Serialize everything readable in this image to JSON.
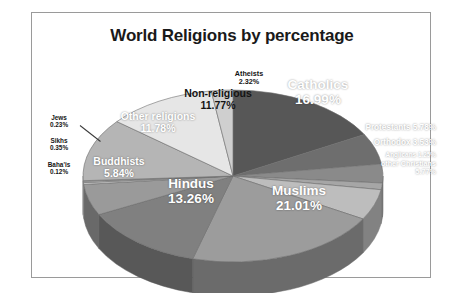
{
  "chart": {
    "title": "World Religions by percentage",
    "border_color": "#9a9a9a",
    "background": "#ffffff"
  },
  "chart_data": {
    "type": "pie",
    "title": "World Religions by percentage",
    "xlabel": "",
    "ylabel": "",
    "units": "percent",
    "three_d": true,
    "legend": "none",
    "labels_position": "inside-and-callout",
    "categories": [
      "Catholics",
      "Protestants",
      "Orthodox",
      "Anglicans",
      "other Christians",
      "Muslims",
      "Hindus",
      "Buddhists",
      "Sikhs",
      "Jews",
      "Baha'is",
      "other religions",
      "Non-religious",
      "Atheists"
    ],
    "values": [
      16.99,
      5.78,
      3.53,
      1.25,
      5.77,
      21.01,
      13.26,
      5.84,
      0.35,
      0.23,
      0.12,
      11.78,
      11.77,
      2.32
    ],
    "slices": [
      {
        "name": "Catholics",
        "value": 16.99,
        "label": "Catholics",
        "value_label": "16.99%",
        "color": "#575757",
        "side_color": "#3c3c3c",
        "text_color": "#ffffff"
      },
      {
        "name": "Protestants",
        "value": 5.78,
        "label": "Protestants",
        "value_label": "5.78%",
        "color": "#6e6e6e",
        "side_color": "#4d4d4d",
        "text_color": "#ffffff"
      },
      {
        "name": "Orthodox",
        "value": 3.53,
        "label": "Orthodox",
        "value_label": "3.53%",
        "color": "#8a8a8a",
        "side_color": "#5f5f5f",
        "text_color": "#ffffff"
      },
      {
        "name": "Anglicans",
        "value": 1.25,
        "label": "Anglicans",
        "value_label": "1.25%",
        "color": "#a6a6a6",
        "side_color": "#737373",
        "text_color": "#ffffff"
      },
      {
        "name": "other Christians",
        "value": 5.77,
        "label": "other Christians",
        "value_label": "5.77%",
        "color": "#bdbdbd",
        "side_color": "#828282",
        "text_color": "#ffffff"
      },
      {
        "name": "Muslims",
        "value": 21.01,
        "label": "Muslims",
        "value_label": "21.01%",
        "color": "#9c9c9c",
        "side_color": "#6b6b6b",
        "text_color": "#ffffff"
      },
      {
        "name": "Hindus",
        "value": 13.26,
        "label": "Hindus",
        "value_label": "13.26%",
        "color": "#808080",
        "side_color": "#585858",
        "text_color": "#ffffff"
      },
      {
        "name": "Buddhists",
        "value": 5.84,
        "label": "Buddhists",
        "value_label": "5.84%",
        "color": "#9a9a9a",
        "side_color": "#696969",
        "text_color": "#ffffff"
      },
      {
        "name": "Sikhs",
        "value": 0.35,
        "label": "Sikhs",
        "value_label": "0.35%",
        "color": "#c9c9c9",
        "side_color": "#8c8c8c",
        "text_color": "#141414"
      },
      {
        "name": "Jews",
        "value": 0.23,
        "label": "Jews",
        "value_label": "0.23%",
        "color": "#d2d2d2",
        "side_color": "#929292",
        "text_color": "#141414"
      },
      {
        "name": "Baha'is",
        "value": 0.12,
        "label": "Baha'is",
        "value_label": "0.12%",
        "color": "#dadada",
        "side_color": "#979797",
        "text_color": "#141414"
      },
      {
        "name": "other religions",
        "value": 11.78,
        "label": "Other religions",
        "value_label": "11.78%",
        "color": "#b5b5b5",
        "side_color": "#7d7d7d",
        "text_color": "#ffffff"
      },
      {
        "name": "Non-religious",
        "value": 11.77,
        "label": "Non-religious",
        "value_label": "11.77%",
        "color": "#e6e6e6",
        "side_color": "#9e9e9e",
        "text_color": "#141414"
      },
      {
        "name": "Atheists",
        "value": 2.32,
        "label": "Atheists",
        "value_label": "2.32%",
        "color": "#cfcfcf",
        "side_color": "#8f8f8f",
        "text_color": "#141414"
      }
    ]
  }
}
